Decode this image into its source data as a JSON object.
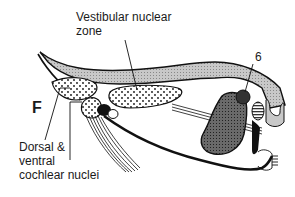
{
  "figure": {
    "panel_letter": "F",
    "labels": {
      "vestibular_line1": "Vestibular nuclear",
      "vestibular_line2": "zone",
      "number_6": "6",
      "cochlear_line1": "Dorsal &",
      "cochlear_line2": "ventral",
      "cochlear_line3": "cochlear nuclei"
    },
    "colors": {
      "ink": "#111111",
      "light_fill": "#cfcfcf",
      "dark_fill": "#555555",
      "background": "#ffffff"
    }
  }
}
